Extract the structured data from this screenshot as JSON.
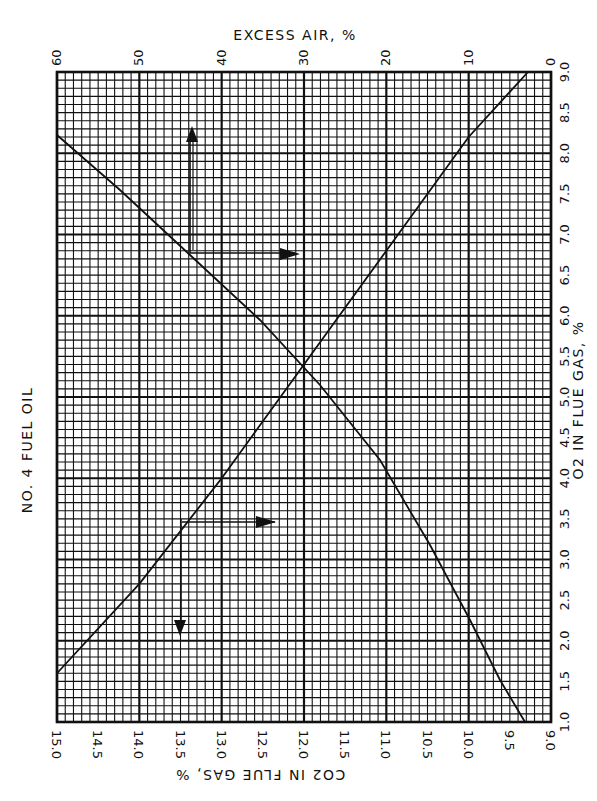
{
  "title": "NO. 4 FUEL OIL",
  "colors": {
    "ink": "#111111",
    "paper": "#ffffff"
  },
  "axes": {
    "top": {
      "label": "EXCESS AIR, %",
      "ticks": [
        "60",
        "50",
        "40",
        "30",
        "20",
        "10",
        "0"
      ],
      "range": [
        60,
        0
      ]
    },
    "right": {
      "label": "O2 IN FLUE GAS, %",
      "ticks": [
        "9.0",
        "8.5",
        "8.0",
        "7.5",
        "7.0",
        "6.5",
        "6.0",
        "5.5",
        "5.0",
        "4.5",
        "4.0",
        "3.5",
        "3.0",
        "2.5",
        "2.0",
        "1.5",
        "1.0"
      ],
      "range": [
        9.0,
        1.0
      ]
    },
    "bottom": {
      "label": "CO2 IN FLUE GAS, %",
      "ticks": [
        "15.0",
        "14.5",
        "14.0",
        "13.5",
        "13.0",
        "12.5",
        "12.0",
        "11.5",
        "11.0",
        "10.5",
        "10.0",
        "9.5",
        "9.0"
      ],
      "range": [
        15.0,
        9.0
      ]
    }
  },
  "chart_data": {
    "type": "line",
    "title": "NO. 4 FUEL OIL",
    "orientation": "rotated 90° (chart printed sideways)",
    "xlabel": "EXCESS AIR, %",
    "ylabel_primary": "O2 IN FLUE GAS, %",
    "ylabel_secondary": "CO2 IN FLUE GAS, %",
    "xlim": [
      0,
      60
    ],
    "ylim_o2": [
      1.0,
      9.0
    ],
    "ylim_co2": [
      9.0,
      15.0
    ],
    "grid": true,
    "series": [
      {
        "name": "O2 in flue gas",
        "axis": "O2",
        "x": [
          2.8,
          10,
          20,
          30,
          40,
          50,
          60
        ],
        "values": [
          9.0,
          8.2,
          6.8,
          5.4,
          4.0,
          2.7,
          1.6
        ]
      },
      {
        "name": "CO2 in flue gas",
        "axis": "CO2",
        "x": [
          3,
          10,
          20,
          30,
          40,
          50,
          60
        ],
        "values": [
          9.0,
          10.2,
          11.3,
          12.1,
          12.9,
          13.6,
          14.2
        ]
      }
    ],
    "annotations": [
      "Arrow example: ~37% excess air → O2 ~6.9% → ~8.3 O2 (upward arrow)",
      "Arrow example: CO2 ~13.4% → O2 ~3.5% (right arrow) → downward arrow at ~2.1"
    ]
  }
}
